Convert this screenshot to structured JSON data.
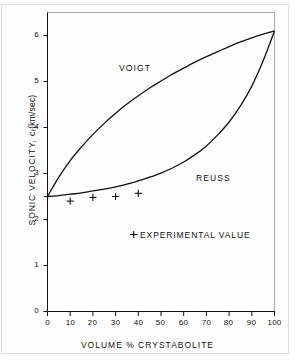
{
  "figure": {
    "background_color": "#fefefe",
    "line_color": "#111111",
    "frame_color": "#dcdcdc"
  },
  "chart_data": {
    "type": "line",
    "title": "",
    "xlabel": "VOLUME % CRYSTABOLITE",
    "ylabel": "SONIC VELOCITY, c",
    "ylabel_subscript": "ℓ",
    "ylabel_units": "(km/sec)",
    "xlim": [
      0,
      100
    ],
    "ylim": [
      0,
      6.5
    ],
    "xticks": [
      0,
      10,
      20,
      30,
      40,
      50,
      60,
      70,
      80,
      90,
      100
    ],
    "xtick_labels": [
      "0",
      "10",
      "20",
      "30",
      "40",
      "50",
      "60",
      "70",
      "80",
      "90",
      "100"
    ],
    "yticks": [
      0,
      1,
      2,
      3,
      4,
      5,
      6
    ],
    "ytick_labels": [
      "0",
      "1",
      "2",
      "3",
      "4",
      "5",
      "6"
    ],
    "grid": false,
    "legend_position": "inside-lower-center",
    "annotations": [
      {
        "name": "voigt-label",
        "text": "VOIGT",
        "x": 28,
        "y": 4.95
      },
      {
        "name": "reuss-label",
        "text": "REUSS",
        "x": 68,
        "y": 2.85
      }
    ],
    "legend_entries": [
      {
        "marker": "+",
        "label": "EXPERIMENTAL VALUE"
      }
    ],
    "series": [
      {
        "name": "VOIGT",
        "type": "line",
        "x": [
          0,
          5,
          10,
          15,
          20,
          25,
          30,
          35,
          40,
          45,
          50,
          55,
          60,
          65,
          70,
          75,
          80,
          85,
          90,
          95,
          100
        ],
        "y": [
          2.5,
          2.92,
          3.28,
          3.58,
          3.85,
          4.09,
          4.31,
          4.51,
          4.69,
          4.86,
          5.01,
          5.16,
          5.29,
          5.42,
          5.54,
          5.65,
          5.76,
          5.86,
          5.95,
          6.03,
          6.1
        ]
      },
      {
        "name": "REUSS",
        "type": "line",
        "x": [
          0,
          5,
          10,
          15,
          20,
          25,
          30,
          35,
          40,
          45,
          50,
          55,
          60,
          65,
          70,
          75,
          80,
          85,
          90,
          95,
          100
        ],
        "y": [
          2.5,
          2.52,
          2.55,
          2.58,
          2.62,
          2.66,
          2.71,
          2.77,
          2.84,
          2.92,
          3.01,
          3.12,
          3.25,
          3.41,
          3.6,
          3.84,
          4.12,
          4.47,
          4.9,
          5.45,
          6.1
        ]
      },
      {
        "name": "EXPERIMENTAL VALUE",
        "type": "scatter",
        "marker": "+",
        "x": [
          0,
          10,
          20,
          30,
          40
        ],
        "y": [
          2.5,
          2.4,
          2.48,
          2.5,
          2.57
        ]
      }
    ]
  }
}
